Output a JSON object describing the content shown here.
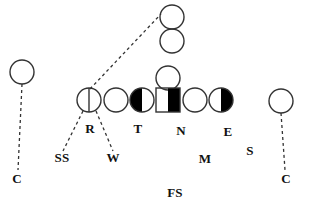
{
  "diagram": {
    "width": 309,
    "height": 211,
    "background_color": "#ffffff",
    "stroke_color": "#333333",
    "fill_color": "#000000",
    "label_color": "#111111"
  },
  "players": [
    {
      "id": "left-corner",
      "shape": "circle-open",
      "cx": 22,
      "cy": 72,
      "r": 12,
      "note": "left wide receiver / split end"
    },
    {
      "id": "slot-receiver-top",
      "shape": "circle-open",
      "cx": 172,
      "cy": 17,
      "r": 12,
      "note": "top stacked receiver"
    },
    {
      "id": "slot-receiver-bottom",
      "shape": "circle-open",
      "cx": 172,
      "cy": 41,
      "r": 12,
      "note": "lower stacked receiver"
    },
    {
      "id": "quarterback",
      "shape": "circle-open",
      "cx": 168,
      "cy": 78,
      "r": 12,
      "note": "quarterback behind center"
    },
    {
      "id": "line-r",
      "shape": "circle-split-vertical",
      "cx": 89,
      "cy": 100,
      "r": 12,
      "note": "offensive lineman aligned with R defender"
    },
    {
      "id": "line-guard-left",
      "shape": "circle-open",
      "cx": 116,
      "cy": 100,
      "r": 12,
      "note": "offensive lineman"
    },
    {
      "id": "line-t",
      "shape": "circle-half-left",
      "cx": 142,
      "cy": 100,
      "r": 12,
      "note": "offensive lineman covered by T"
    },
    {
      "id": "center-n",
      "shape": "square-half-right",
      "cx": 168,
      "cy": 100,
      "size": 24,
      "note": "center covered by N"
    },
    {
      "id": "line-guard-right",
      "shape": "circle-open",
      "cx": 195,
      "cy": 100,
      "r": 12,
      "note": "offensive lineman"
    },
    {
      "id": "line-e",
      "shape": "circle-half-right",
      "cx": 221,
      "cy": 100,
      "r": 12,
      "note": "offensive lineman covered by E"
    },
    {
      "id": "right-corner",
      "shape": "circle-open",
      "cx": 281,
      "cy": 101,
      "r": 12,
      "note": "right wide receiver / split end"
    }
  ],
  "connectors": [
    {
      "id": "left-corner-to-c",
      "x1": 22,
      "y1": 84,
      "x2": 18,
      "y2": 170,
      "style": "dashed"
    },
    {
      "id": "right-corner-to-c",
      "x1": 281,
      "y1": 113,
      "x2": 285,
      "y2": 170,
      "style": "dashed"
    },
    {
      "id": "r-to-slot-receiver",
      "x1": 90,
      "y1": 89,
      "x2": 161,
      "y2": 14,
      "style": "dashed"
    },
    {
      "id": "r-to-ss",
      "x1": 83,
      "y1": 111,
      "x2": 63,
      "y2": 151,
      "style": "dashed"
    },
    {
      "id": "r-to-w",
      "x1": 96,
      "y1": 111,
      "x2": 113,
      "y2": 151,
      "style": "dashed"
    }
  ],
  "labels": [
    {
      "id": "label-r",
      "text": "R",
      "x": 90,
      "y": 128
    },
    {
      "id": "label-t",
      "text": "T",
      "x": 138,
      "y": 128
    },
    {
      "id": "label-n",
      "text": "N",
      "x": 181,
      "y": 130
    },
    {
      "id": "label-e",
      "text": "E",
      "x": 228,
      "y": 131
    },
    {
      "id": "label-ss",
      "text": "SS",
      "x": 62,
      "y": 157
    },
    {
      "id": "label-w",
      "text": "W",
      "x": 113,
      "y": 157
    },
    {
      "id": "label-m",
      "text": "M",
      "x": 205,
      "y": 158
    },
    {
      "id": "label-s",
      "text": "S",
      "x": 250,
      "y": 150
    },
    {
      "id": "label-c-left",
      "text": "C",
      "x": 17,
      "y": 178
    },
    {
      "id": "label-c-right",
      "text": "C",
      "x": 286,
      "y": 178
    },
    {
      "id": "label-fs",
      "text": "FS",
      "x": 175,
      "y": 192
    }
  ]
}
